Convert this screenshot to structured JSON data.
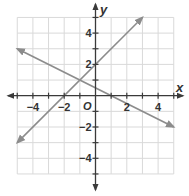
{
  "chart_data": {
    "type": "line",
    "title": "",
    "xlabel": "x",
    "ylabel": "y",
    "origin_label": "O",
    "xlim": [
      -5,
      5
    ],
    "ylim": [
      -5,
      5
    ],
    "grid": true,
    "grid_step": 1,
    "x_ticks": [
      -4,
      -2,
      2,
      4
    ],
    "y_ticks": [
      4,
      2,
      -2,
      -4
    ],
    "x_tick_labels": [
      "−4",
      "−2",
      "2",
      "4"
    ],
    "y_tick_labels": [
      "4",
      "2",
      "−2",
      "−4"
    ],
    "colors": {
      "series": "#8c8c8c",
      "axis": "#3a3a3a",
      "grid": "#d9d9d9"
    },
    "series": [
      {
        "name": "y = x + 2",
        "slope": 1,
        "intercept": 2,
        "points": [
          [
            -5,
            -3
          ],
          [
            3,
            5
          ]
        ],
        "arrows": "both"
      },
      {
        "name": "y = -0.5x + 0.5",
        "slope": -0.5,
        "intercept": 0.5,
        "points": [
          [
            -5,
            3
          ],
          [
            5,
            -2
          ]
        ],
        "arrows": "both"
      }
    ]
  }
}
